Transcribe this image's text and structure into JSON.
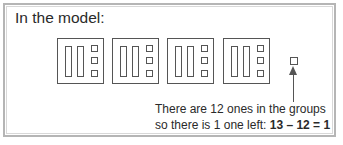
{
  "title": "In the model:",
  "groups": [
    {
      "label": "group-1",
      "bars": 2,
      "units": 3
    },
    {
      "label": "group-2",
      "bars": 2,
      "units": 3
    },
    {
      "label": "group-3",
      "bars": 2,
      "units": 3
    },
    {
      "label": "group-4",
      "bars": 2,
      "units": 3
    }
  ],
  "leftover_units": 1,
  "note": {
    "line1": "There are 12 ones in the groups",
    "line2_prefix": "so there is 1 one left: ",
    "equation": "13 – 12 = 1"
  },
  "colors": {
    "stroke": "#555555",
    "frame": "#b5b5b5",
    "text": "#2a2a2a"
  }
}
